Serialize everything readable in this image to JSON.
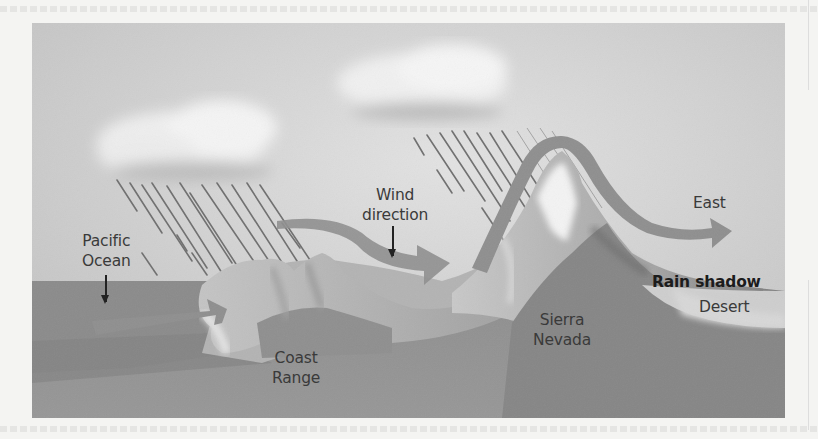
{
  "figure": {
    "labels": {
      "pacific_ocean": [
        "Pacific",
        "Ocean"
      ],
      "wind_direction": [
        "Wind",
        "direction"
      ],
      "east": "East",
      "rain_shadow": "Rain shadow",
      "desert": "Desert",
      "sierra_nevada": [
        "Sierra",
        "Nevada"
      ],
      "coast_range": [
        "Coast",
        "Range"
      ]
    },
    "colors": {
      "sky": "#cfcfcf",
      "cloud": "#ececec",
      "rain": "#6e6e6e",
      "ocean": "#8a8a8a",
      "ground": "#8e8e8e",
      "mountain_light": "#b8b8b8",
      "snow": "#f2f2f2",
      "wind_arrow": "#8f8f8f",
      "text": "#3a3a3a"
    }
  }
}
